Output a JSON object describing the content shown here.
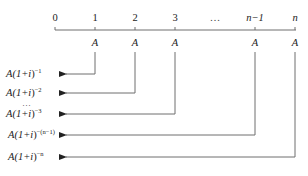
{
  "diagram": {
    "timeline": {
      "ticks": [
        {
          "label": "0",
          "x": 55
        },
        {
          "label": "1",
          "x": 95
        },
        {
          "label": "2",
          "x": 135
        },
        {
          "label": "3",
          "x": 175
        },
        {
          "label": "…",
          "x": 215
        },
        {
          "label": "n−1",
          "x": 255
        },
        {
          "label": "n",
          "x": 295
        }
      ]
    },
    "payments": [
      {
        "label": "A",
        "x": 95
      },
      {
        "label": "A",
        "x": 135
      },
      {
        "label": "A",
        "x": 175
      },
      {
        "label": "A",
        "x": 255
      },
      {
        "label": "A",
        "x": 295
      }
    ],
    "present_values": [
      {
        "base": "A(1+",
        "var": "i",
        "close": ")",
        "exp": "−1",
        "y": 74
      },
      {
        "base": "A(1+",
        "var": "i",
        "close": ")",
        "exp": "−2",
        "y": 93
      },
      {
        "base": "A(1+",
        "var": "i",
        "close": ")",
        "exp": "−3",
        "y": 114
      },
      {
        "base": "A(1+",
        "var": "i",
        "close": ")",
        "exp": "−(n−1)",
        "y": 135
      },
      {
        "base": "A(1+",
        "var": "i",
        "close": ")",
        "exp": "−n",
        "y": 157
      }
    ],
    "ellipsis": "…",
    "line_color": "#6e6e6e"
  }
}
